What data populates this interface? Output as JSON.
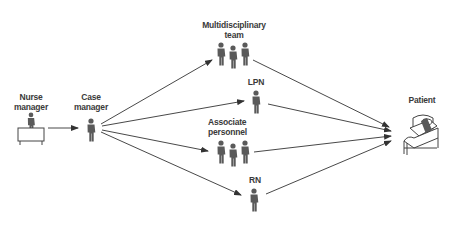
{
  "diagram": {
    "nodes": [
      {
        "id": "nurse_manager",
        "label_line1": "Nurse",
        "label_line2": "manager",
        "icon": "person-at-desk"
      },
      {
        "id": "case_manager",
        "label_line1": "Case",
        "label_line2": "manager",
        "icon": "person"
      },
      {
        "id": "multidisciplinary_team",
        "label_line1": "Multidisciplinary",
        "label_line2": "team",
        "icon": "group-of-three"
      },
      {
        "id": "lpn",
        "label_line1": "LPN",
        "icon": "person"
      },
      {
        "id": "associate_personnel",
        "label_line1": "Associate",
        "label_line2": "personnel",
        "icon": "group-of-three"
      },
      {
        "id": "rn",
        "label_line1": "RN",
        "icon": "person"
      },
      {
        "id": "patient",
        "label_line1": "Patient",
        "icon": "patient-in-bed"
      }
    ],
    "edges": [
      {
        "from": "nurse_manager",
        "to": "case_manager"
      },
      {
        "from": "case_manager",
        "to": "multidisciplinary_team"
      },
      {
        "from": "case_manager",
        "to": "lpn"
      },
      {
        "from": "case_manager",
        "to": "associate_personnel"
      },
      {
        "from": "case_manager",
        "to": "rn"
      },
      {
        "from": "multidisciplinary_team",
        "to": "patient"
      },
      {
        "from": "lpn",
        "to": "patient"
      },
      {
        "from": "associate_personnel",
        "to": "patient"
      },
      {
        "from": "rn",
        "to": "patient"
      }
    ],
    "colors": {
      "line": "#333333",
      "figure": "#5a5a5a",
      "text": "#3a3a3a"
    }
  }
}
